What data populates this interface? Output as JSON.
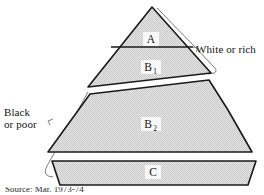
{
  "figure": {
    "type": "stratification-pyramid-diagram",
    "regions": [
      {
        "id": "A",
        "label": "A",
        "shape": "triangle-apex",
        "position": "top"
      },
      {
        "id": "B1",
        "label": "B",
        "sub": "1",
        "shape": "trapezoid",
        "position": "upper-middle"
      },
      {
        "id": "B2",
        "label": "B",
        "sub": "2",
        "shape": "slanted-polygon",
        "position": "lower-middle"
      },
      {
        "id": "C",
        "label": "C",
        "shape": "trapezoid-band",
        "position": "bottom"
      }
    ],
    "annotations": {
      "right_label": "White or rich",
      "left_label_line1": "Black",
      "left_label_line2": "or poor"
    },
    "caption_fragment": "Source: Mar. 1973-74",
    "colors": {
      "fill": "#dcdcdc",
      "stroke": "#1a1a1a",
      "bracket": "#4a4a4a",
      "text": "#141414",
      "background": "#ffffff"
    }
  }
}
